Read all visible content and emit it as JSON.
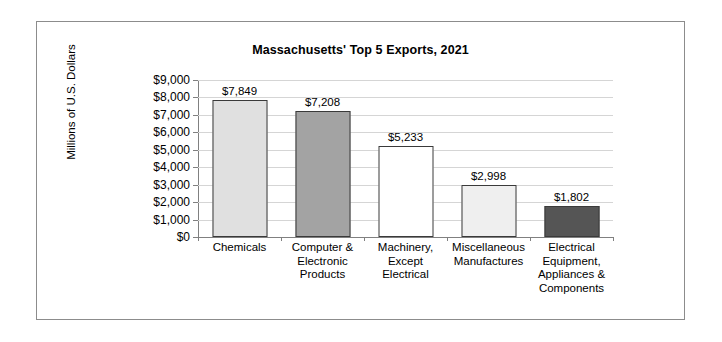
{
  "chart_data": {
    "type": "bar",
    "title": "Massachusetts' Top 5 Exports, 2021",
    "xlabel": "",
    "ylabel": "Millions of U.S. Dollars",
    "categories": [
      "Chemicals",
      "Computer &\nElectronic\nProducts",
      "Machinery,\nExcept\nElectrical",
      "Miscellaneous\nManufactures",
      "Electrical\nEquipment,\nAppliances &\nComponents"
    ],
    "values": [
      7849,
      7208,
      5233,
      2998,
      1802
    ],
    "value_labels": [
      "$7,849",
      "$7,208",
      "$5,233",
      "$2,998",
      "$1,802"
    ],
    "bar_colors": [
      "#e0e0e0",
      "#a3a3a3",
      "#ffffff",
      "#efefef",
      "#555555"
    ],
    "bar_edge_color": "#3a3a3a",
    "ylim": [
      0,
      9000
    ],
    "ytick_values": [
      9000,
      8000,
      7000,
      6000,
      5000,
      4000,
      3000,
      2000,
      1000,
      0
    ],
    "ytick_labels": [
      "$9,000",
      "$8,000",
      "$7,000",
      "$6,000",
      "$5,000",
      "$4,000",
      "$3,000",
      "$2,000",
      "$1,000",
      "$0"
    ],
    "grid": true,
    "legend": "none",
    "frame_border_color": "#8c8c8c",
    "gridline_color": "#d5d5d5",
    "axis_color": "#808080"
  }
}
